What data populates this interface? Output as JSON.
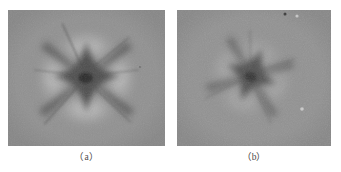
{
  "figure": {
    "background_color": "#ffffff",
    "panels": [
      {
        "id": "panel-a",
        "caption": "（a）",
        "caption_plain": "(a)",
        "image_type": "grayscale-astroid-pattern",
        "base_gray": "#909090",
        "core_gray": "#3a3a3a",
        "bright_lobe_gray": "#c6c6c6",
        "lobe_count": 4,
        "rotation_deg": 0,
        "description": "Four-lobed symmetric astroid with dark concave star core, bright lobes top/bottom/left/right, thin dark streaks from cusps"
      },
      {
        "id": "panel-b",
        "caption": "（b）",
        "caption_plain": "(b)",
        "image_type": "grayscale-astroid-pattern",
        "base_gray": "#919191",
        "core_gray": "#454545",
        "bright_lobe_gray": "#b8b8b8",
        "lobe_count": 4,
        "rotation_deg": 22,
        "description": "Four-lobed astroid rotated about 22 degrees, pinwheel appearance, smaller and softer than panel a"
      }
    ],
    "specks": [
      {
        "panel": "panel-b",
        "kind": "dark-speck",
        "x_pct": 70.5,
        "y_pct": 3.0,
        "color": "#3c3c3c"
      },
      {
        "panel": "panel-b",
        "kind": "light-speck",
        "x_pct": 78.0,
        "y_pct": 4.5,
        "color": "#cfcfcf"
      },
      {
        "panel": "panel-b",
        "kind": "light-speck",
        "x_pct": 81.0,
        "y_pct": 72.5,
        "color": "#cacaca"
      },
      {
        "panel": "panel-a",
        "kind": "dark-speck",
        "x_pct": 84.0,
        "y_pct": 42.0,
        "color": "#6a6a6a"
      }
    ]
  }
}
